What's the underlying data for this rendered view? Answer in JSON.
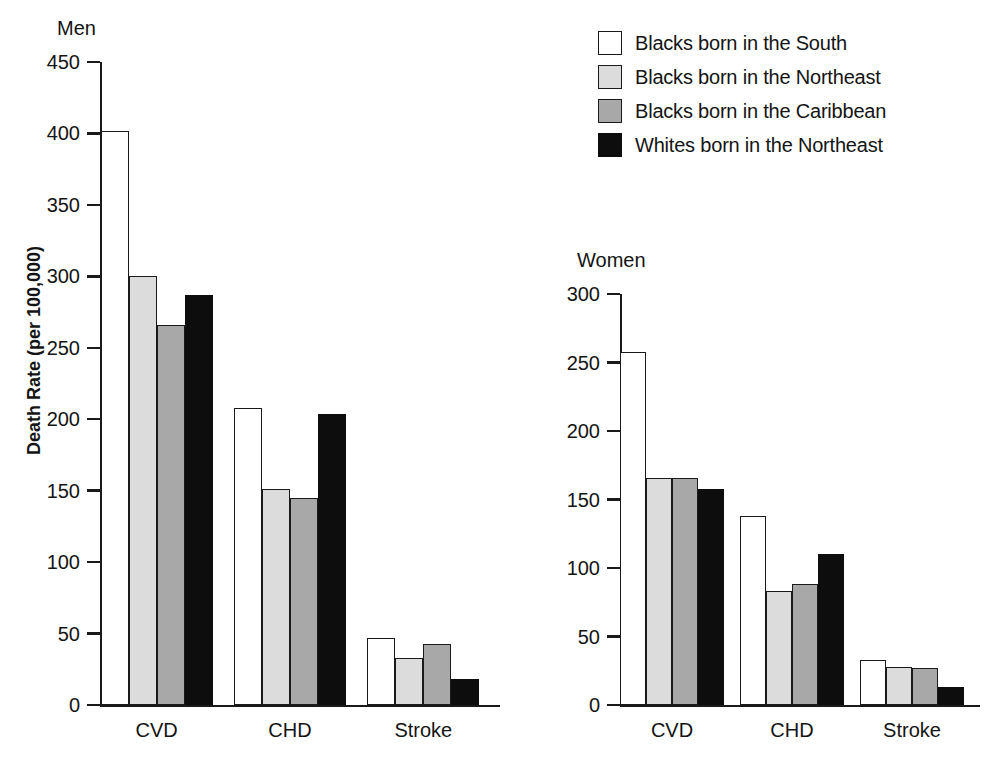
{
  "legend": {
    "items": [
      {
        "label": "Blacks born in the South",
        "swatch": "white",
        "color": "#ffffff"
      },
      {
        "label": "Blacks born in the Northeast",
        "swatch": "light-gray",
        "color": "#dcdcdc"
      },
      {
        "label": "Blacks born in the Caribbean",
        "swatch": "medium-gray",
        "color": "#a8a8a8"
      },
      {
        "label": "Whites born in the Northeast",
        "swatch": "black",
        "color": "#0d0d0d"
      }
    ]
  },
  "panels": {
    "men": {
      "title": "Men",
      "ylabel": "Death Rate (per 100,000)",
      "yticks": [
        "450",
        "400",
        "350",
        "300",
        "250",
        "200",
        "150",
        "100",
        "50",
        "0"
      ],
      "categories": [
        "CVD",
        "CHD",
        "Stroke"
      ]
    },
    "women": {
      "title": "Women",
      "ylabel": "",
      "yticks": [
        "300",
        "250",
        "200",
        "150",
        "100",
        "50",
        "0"
      ],
      "categories": [
        "CVD",
        "CHD",
        "Stroke"
      ]
    }
  },
  "chart_data": [
    {
      "type": "bar",
      "title": "Men",
      "xlabel": "",
      "ylabel": "Death Rate (per 100,000)",
      "ylim": [
        0,
        450
      ],
      "ytick_step": 50,
      "grid": false,
      "legend_position": "top-right (shared)",
      "categories": [
        "CVD",
        "CHD",
        "Stroke"
      ],
      "series": [
        {
          "name": "Blacks born in the South",
          "values": [
            402,
            208,
            47
          ]
        },
        {
          "name": "Blacks born in the Northeast",
          "values": [
            300,
            151,
            33
          ]
        },
        {
          "name": "Blacks born in the Caribbean",
          "values": [
            266,
            145,
            43
          ]
        },
        {
          "name": "Whites born in the Northeast",
          "values": [
            287,
            204,
            18
          ]
        }
      ]
    },
    {
      "type": "bar",
      "title": "Women",
      "xlabel": "",
      "ylabel": "",
      "ylim": [
        0,
        300
      ],
      "ytick_step": 50,
      "grid": false,
      "legend_position": "top-right (shared)",
      "categories": [
        "CVD",
        "CHD",
        "Stroke"
      ],
      "series": [
        {
          "name": "Blacks born in the South",
          "values": [
            258,
            138,
            33
          ]
        },
        {
          "name": "Blacks born in the Northeast",
          "values": [
            166,
            83,
            28
          ]
        },
        {
          "name": "Blacks born in the Caribbean",
          "values": [
            166,
            88,
            27
          ]
        },
        {
          "name": "Whites born in the Northeast",
          "values": [
            158,
            110,
            13
          ]
        }
      ]
    }
  ]
}
